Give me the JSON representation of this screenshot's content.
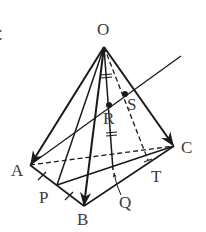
{
  "diagram": {
    "type": "geometry-figure",
    "colors": {
      "stroke": "#1a1a1a",
      "label": "#3a3a3a",
      "background": "#ffffff"
    },
    "edge_glyph": "：",
    "labels": {
      "O": "O",
      "A": "A",
      "B": "B",
      "C": "C",
      "P": "P",
      "Q": "Q",
      "R": "R",
      "S": "S",
      "T": "T"
    },
    "points": {
      "O": [
        104,
        47
      ],
      "A": [
        30,
        165
      ],
      "B": [
        84,
        206
      ],
      "C": [
        174,
        146
      ],
      "P": [
        57,
        185
      ],
      "Q": [
        113,
        170
      ],
      "R": [
        109,
        105
      ],
      "S": [
        125,
        94
      ],
      "T": [
        148,
        160
      ],
      "line_end": [
        181,
        56
      ]
    },
    "segments": [
      {
        "from": "O",
        "to": "A",
        "style": "solid",
        "arrow": true
      },
      {
        "from": "O",
        "to": "B",
        "style": "solid",
        "arrow": true
      },
      {
        "from": "O",
        "to": "C",
        "style": "solid",
        "arrow": true
      },
      {
        "from": "A",
        "to": "B",
        "style": "solid"
      },
      {
        "from": "B",
        "to": "C",
        "style": "solid"
      },
      {
        "from": "A",
        "to": "C",
        "style": "dashed"
      },
      {
        "from": "O",
        "to": "P",
        "style": "solid"
      },
      {
        "from": "P",
        "to": "C",
        "style": "solid"
      },
      {
        "from": "O",
        "to": "Q",
        "style": "solid"
      },
      {
        "from": "O",
        "to": "T",
        "style": "dashed"
      },
      {
        "from": "A",
        "to": "line_end",
        "style": "solid",
        "through": [
          "R",
          "S"
        ]
      }
    ],
    "marks": [
      {
        "on": "AP",
        "type": "single-tick"
      },
      {
        "on": "PB",
        "type": "single-tick"
      },
      {
        "on": "OR",
        "type": "double-tick"
      },
      {
        "on": "RQ",
        "type": "double-tick"
      }
    ]
  }
}
